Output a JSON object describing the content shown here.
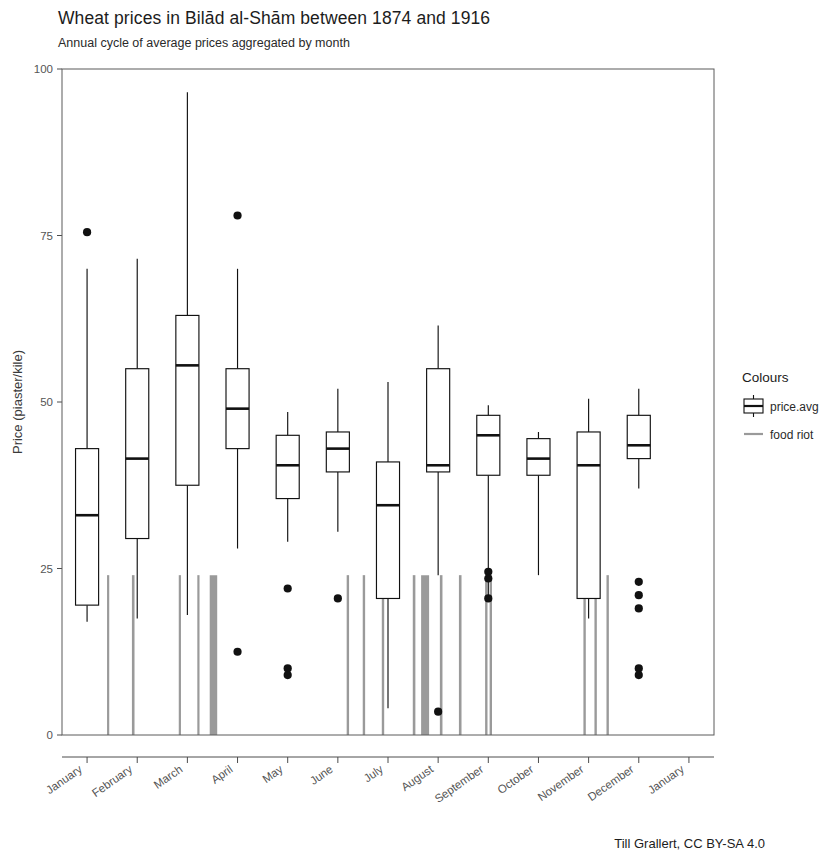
{
  "header": {
    "title": "Wheat prices in Bilād al-Shām between 1874 and 1916",
    "subtitle": "Annual cycle of average prices aggregated by month"
  },
  "caption": "Till Grallert, CC BY-SA 4.0",
  "legend": {
    "title": "Colours",
    "items": [
      {
        "label": "price.avg",
        "glyph": "boxplot-glyph",
        "color": "#111111"
      },
      {
        "label": "food riot",
        "glyph": "line-glyph",
        "color": "#9a9a9a"
      }
    ]
  },
  "axes": {
    "y_title": "Price (piaster/kile)",
    "y_ticks": [
      "0",
      "25",
      "50",
      "75",
      "100"
    ],
    "y_tick_values": [
      0,
      25,
      50,
      75,
      100
    ],
    "ylim": [
      0,
      100
    ],
    "x_ticks": [
      "January",
      "February",
      "March",
      "April",
      "May",
      "June",
      "July",
      "August",
      "September",
      "October",
      "November",
      "December",
      "January"
    ]
  },
  "chart_data": {
    "type": "boxplot",
    "title": "Wheat prices in Bilād al-Shām between 1874 and 1916",
    "subtitle": "Annual cycle of average prices aggregated by month",
    "xlabel": "",
    "ylabel": "Price (piaster/kile)",
    "ylim": [
      0,
      100
    ],
    "grid": false,
    "legend_position": "right",
    "categories": [
      "January",
      "February",
      "March",
      "April",
      "May",
      "June",
      "July",
      "August",
      "September",
      "October",
      "November",
      "December",
      "January"
    ],
    "series": [
      {
        "name": "price.avg",
        "color": "#111111",
        "boxes": [
          {
            "category": "January",
            "x": 1,
            "whisker_low": 17.0,
            "q1": 19.5,
            "median": 33.0,
            "q3": 43.0,
            "whisker_high": 70.0,
            "outliers": [
              75.5
            ]
          },
          {
            "category": "February",
            "x": 2,
            "whisker_low": 17.5,
            "q1": 29.5,
            "median": 41.5,
            "q3": 55.0,
            "whisker_high": 71.5,
            "outliers": []
          },
          {
            "category": "March",
            "x": 3,
            "whisker_low": 18.0,
            "q1": 37.5,
            "median": 55.5,
            "q3": 63.0,
            "whisker_high": 96.5,
            "outliers": []
          },
          {
            "category": "April",
            "x": 4,
            "whisker_low": 28.0,
            "q1": 43.0,
            "median": 49.0,
            "q3": 55.0,
            "whisker_high": 70.0,
            "outliers": [
              78.0,
              12.5
            ]
          },
          {
            "category": "May",
            "x": 5,
            "whisker_low": 29.0,
            "q1": 35.5,
            "median": 40.5,
            "q3": 45.0,
            "whisker_high": 48.5,
            "outliers": [
              22.0,
              10.0,
              9.0
            ]
          },
          {
            "category": "June",
            "x": 6,
            "whisker_low": 30.5,
            "q1": 39.5,
            "median": 43.0,
            "q3": 45.5,
            "whisker_high": 52.0,
            "outliers": [
              20.5
            ]
          },
          {
            "category": "July",
            "x": 7,
            "whisker_low": 4.0,
            "q1": 20.5,
            "median": 34.5,
            "q3": 41.0,
            "whisker_high": 53.0,
            "outliers": []
          },
          {
            "category": "August",
            "x": 8,
            "whisker_low": 24.0,
            "q1": 39.5,
            "median": 40.5,
            "q3": 55.0,
            "whisker_high": 61.5,
            "outliers": [
              3.5
            ]
          },
          {
            "category": "September",
            "x": 9,
            "whisker_low": 20.0,
            "q1": 39.0,
            "median": 45.0,
            "q3": 48.0,
            "whisker_high": 49.5,
            "outliers": [
              24.5,
              23.5,
              20.5
            ]
          },
          {
            "category": "October",
            "x": 10,
            "whisker_low": 24.0,
            "q1": 39.0,
            "median": 41.5,
            "q3": 44.5,
            "whisker_high": 45.5,
            "outliers": []
          },
          {
            "category": "November",
            "x": 11,
            "whisker_low": 17.5,
            "q1": 20.5,
            "median": 40.5,
            "q3": 45.5,
            "whisker_high": 50.5,
            "outliers": []
          },
          {
            "category": "December",
            "x": 12,
            "whisker_low": 37.0,
            "q1": 41.5,
            "median": 43.5,
            "q3": 48.0,
            "whisker_high": 52.0,
            "outliers": [
              23.0,
              21.0,
              19.0,
              10.0,
              9.0
            ]
          }
        ]
      },
      {
        "name": "food riot",
        "color": "#9a9a9a",
        "note": "Vertical grey lines mark food riot events; each spans from 0 to about 24 piaster/kile.",
        "y_low": 0,
        "y_high": 24.0,
        "events": [
          {
            "x_month": 1.42,
            "width": 2.2
          },
          {
            "x_month": 1.92,
            "width": 2.6
          },
          {
            "x_month": 2.85,
            "width": 2.2
          },
          {
            "x_month": 3.22,
            "width": 2.2
          },
          {
            "x_month": 3.52,
            "width": 7.5
          },
          {
            "x_month": 6.2,
            "width": 2.4
          },
          {
            "x_month": 6.52,
            "width": 2.4
          },
          {
            "x_month": 6.9,
            "width": 2.4
          },
          {
            "x_month": 7.52,
            "width": 2.6
          },
          {
            "x_month": 7.74,
            "width": 8.0
          },
          {
            "x_month": 8.06,
            "width": 2.6
          },
          {
            "x_month": 8.44,
            "width": 2.6
          },
          {
            "x_month": 8.96,
            "width": 2.4
          },
          {
            "x_month": 9.05,
            "width": 2.4
          },
          {
            "x_month": 10.92,
            "width": 2.4
          },
          {
            "x_month": 11.14,
            "width": 2.4
          },
          {
            "x_month": 11.38,
            "width": 2.4
          }
        ]
      }
    ]
  }
}
